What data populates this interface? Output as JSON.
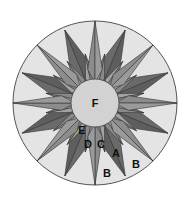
{
  "diagram": {
    "center": [
      95,
      103
    ],
    "outer_radius": 82,
    "center_radius": 24,
    "colors": {
      "background_ring": "#e4e4e4",
      "outline": "#555555",
      "long_points": "#8c8c8c",
      "dark_points": "#5e5e5e",
      "mid_points": "#a2a2a2",
      "center_circle": "#d2d2d2"
    },
    "labels": [
      {
        "text": "F",
        "x": 95,
        "y": 107
      },
      {
        "text": "E",
        "x": 82,
        "y": 134
      },
      {
        "text": "D",
        "x": 88,
        "y": 148
      },
      {
        "text": "C",
        "x": 101,
        "y": 148
      },
      {
        "text": "A",
        "x": 116,
        "y": 157
      },
      {
        "text": "B",
        "x": 136,
        "y": 168
      },
      {
        "text": "B",
        "x": 107,
        "y": 177
      }
    ]
  }
}
